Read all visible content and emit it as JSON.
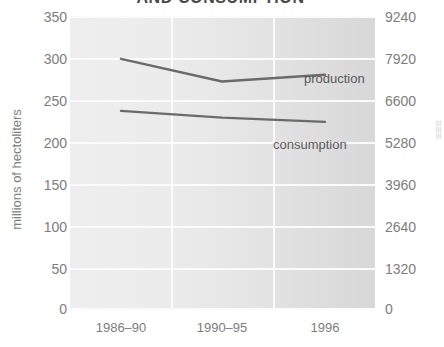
{
  "chart_data": {
    "type": "line",
    "title": "AND CONSUMPTION",
    "xlabel": "",
    "ylabel": "millions of hectoliters",
    "categories": [
      "1986–90",
      "1990–95",
      "1996"
    ],
    "series": [
      {
        "name": "production",
        "values": [
          299,
          272,
          280
        ]
      },
      {
        "name": "consumption",
        "values": [
          237,
          229,
          224
        ]
      }
    ],
    "ylim": [
      0,
      350
    ],
    "yticks": [
      0,
      50,
      100,
      150,
      200,
      250,
      300,
      350
    ],
    "secondary_axis": {
      "ylim": [
        0,
        9240
      ],
      "yticks": [
        0,
        1320,
        2640,
        3960,
        5280,
        6600,
        7920,
        9240
      ],
      "label": ""
    },
    "grid": true,
    "legend": "inline-labels",
    "colors": {
      "plot_background": "#e8e8e8",
      "gridline": "#fbfbfb",
      "line": "#6b6b6b",
      "tick_text": "#7d7d7d",
      "title_text": "#4a4a4a"
    }
  },
  "axes": {
    "left_ticks": [
      "350",
      "300",
      "250",
      "200",
      "150",
      "100",
      "50",
      "0"
    ],
    "right_ticks": [
      "9240",
      "7920",
      "6600",
      "5280",
      "3960",
      "2640",
      "1320",
      "0"
    ],
    "x_ticks": [
      "1986–90",
      "1990–95",
      "1996"
    ],
    "y_title": "millions of hectoliters"
  },
  "series_labels": {
    "production": "production",
    "consumption": "consumption"
  },
  "edge_text": "≡≡≡"
}
